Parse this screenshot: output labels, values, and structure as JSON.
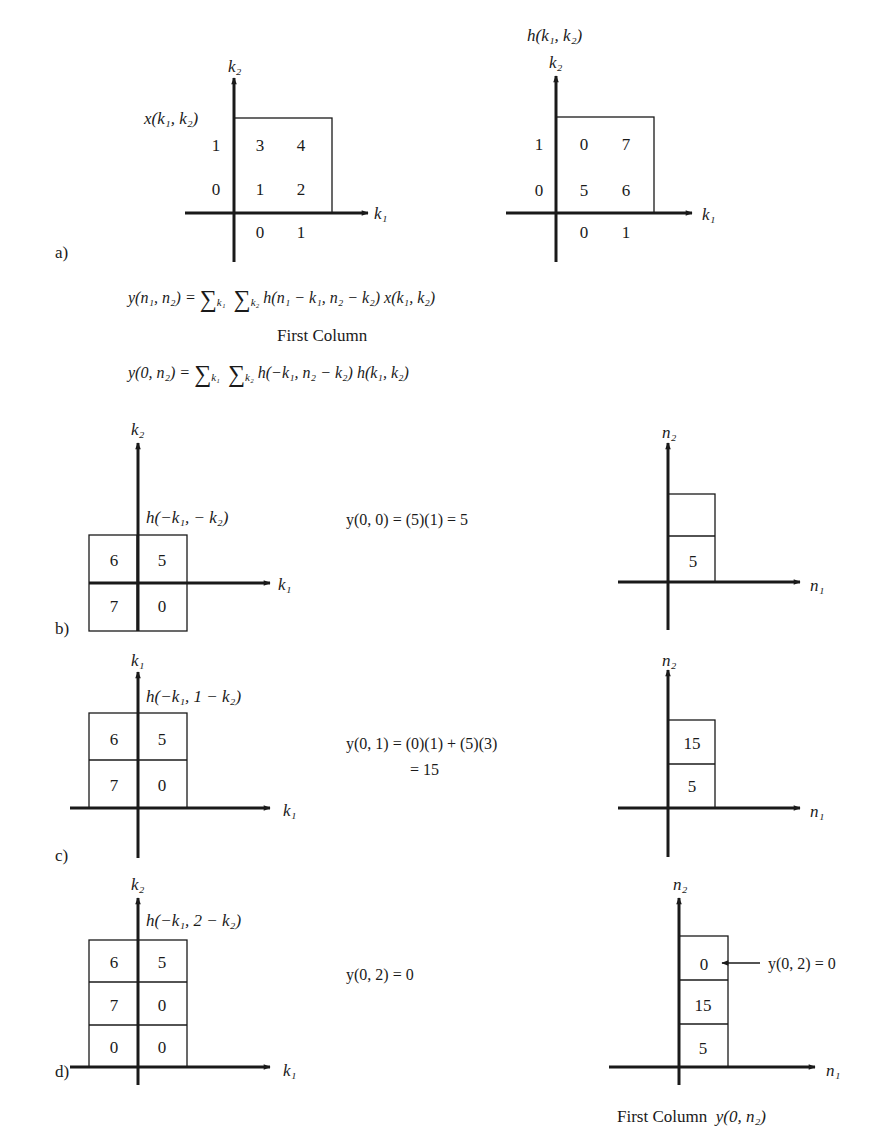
{
  "figure": {
    "panel_a": {
      "label": "a)",
      "x_plot": {
        "title": "x(k₁, k₂)",
        "x_axis": "k₁",
        "y_axis": "k₂",
        "x_ticks": [
          "0",
          "1"
        ],
        "y_ticks": [
          "0",
          "1"
        ],
        "values": {
          "r1c0": "3",
          "r1c1": "4",
          "r0c0": "1",
          "r0c1": "2"
        }
      },
      "h_plot": {
        "title": "h(k₁, k₂)",
        "x_axis": "k₁",
        "y_axis": "k₂",
        "x_ticks": [
          "0",
          "1"
        ],
        "y_ticks": [
          "0",
          "1"
        ],
        "values": {
          "r1c0": "0",
          "r1c1": "7",
          "r0c0": "5",
          "r0c1": "6"
        }
      }
    },
    "equations": {
      "convolution_lhs": "y(n₁, n₂) =",
      "convolution_sum1": "k₁",
      "convolution_sum2": "k₂",
      "convolution_rhs": "h(n₁ − k₁, n₂ − k₂)  x(k₁, k₂)",
      "first_column_heading": "First Column",
      "first_column_lhs": "y(0, n₂) =",
      "first_column_rhs": "h(−k₁, n₂ − k₂)  h(k₁, k₂)"
    },
    "panel_b": {
      "label": "b)",
      "left_plot": {
        "y_axis": "k₂",
        "x_axis": "k₁",
        "caption": "h(−k₁, − k₂)",
        "cells": {
          "top_left": "6",
          "top_right": "5",
          "bottom_left": "7",
          "bottom_right": "0"
        }
      },
      "equation": "y(0, 0) = (5)(1) = 5",
      "right_plot": {
        "y_axis": "n₂",
        "x_axis": "n₁",
        "cells": [
          "5",
          ""
        ]
      }
    },
    "panel_c": {
      "label": "c)",
      "left_plot": {
        "y_axis": "k₁",
        "x_axis": "k₁",
        "caption": "h(−k₁, 1 − k₂)",
        "cells": {
          "top_left": "6",
          "top_right": "5",
          "bottom_left": "7",
          "bottom_right": "0"
        }
      },
      "equation_line1": "y(0, 1) = (0)(1) + (5)(3)",
      "equation_line2": "= 15",
      "right_plot": {
        "y_axis": "n₂",
        "x_axis": "n₁",
        "cells": [
          "5",
          "15"
        ]
      }
    },
    "panel_d": {
      "label": "d)",
      "left_plot": {
        "y_axis": "k₂",
        "x_axis": "k₁",
        "caption": "h(−k₁, 2 − k₂)",
        "cells": {
          "top_left": "6",
          "top_right": "5",
          "mid_left": "7",
          "mid_right": "0",
          "bottom_left": "0",
          "bottom_right": "0"
        }
      },
      "equation": "y(0, 2) = 0",
      "right_plot": {
        "y_axis": "n₂",
        "x_axis": "n₁",
        "cells": [
          "5",
          "15",
          "0"
        ],
        "annotation": "y(0, 2) = 0"
      },
      "caption_text": "First Column",
      "caption_symbol": "y(0, n₂)"
    }
  }
}
